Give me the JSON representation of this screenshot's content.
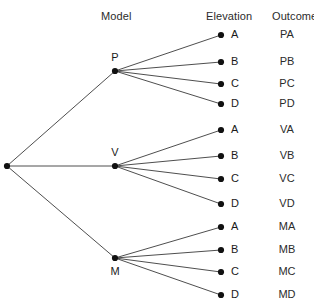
{
  "headers": {
    "model": "Model",
    "elevation": "Elevation",
    "outcome": "Outcome"
  },
  "top_cut_text": "",
  "colors": {
    "background": "#ffffff",
    "line": "#3a3a3a",
    "node": "#111111",
    "text": "#1a1a1a"
  },
  "chart_data": {
    "type": "tree",
    "title": "",
    "columns": [
      "Model",
      "Elevation",
      "Outcome"
    ],
    "root": {
      "label": "",
      "x": 7,
      "y": 166
    },
    "levels": [
      {
        "name": "Model",
        "nodes": [
          {
            "label": "P",
            "x": 115,
            "y": 71,
            "label_pos": "above"
          },
          {
            "label": "V",
            "x": 115,
            "y": 166,
            "label_pos": "above"
          },
          {
            "label": "M",
            "x": 115,
            "y": 258,
            "label_pos": "below"
          }
        ]
      },
      {
        "name": "Elevation",
        "nodes": [
          {
            "label": "A",
            "x": 221,
            "y": 35,
            "parent": "P",
            "outcome": "PA"
          },
          {
            "label": "B",
            "x": 221,
            "y": 62,
            "parent": "P",
            "outcome": "PB"
          },
          {
            "label": "C",
            "x": 221,
            "y": 84,
            "parent": "P",
            "outcome": "PC"
          },
          {
            "label": "D",
            "x": 221,
            "y": 104,
            "parent": "P",
            "outcome": "PD"
          },
          {
            "label": "A",
            "x": 221,
            "y": 130,
            "parent": "V",
            "outcome": "VA"
          },
          {
            "label": "B",
            "x": 221,
            "y": 156,
            "parent": "V",
            "outcome": "VB"
          },
          {
            "label": "C",
            "x": 221,
            "y": 179,
            "parent": "V",
            "outcome": "VC"
          },
          {
            "label": "D",
            "x": 221,
            "y": 204,
            "parent": "V",
            "outcome": "VD"
          },
          {
            "label": "A",
            "x": 221,
            "y": 227,
            "parent": "M",
            "outcome": "MA"
          },
          {
            "label": "B",
            "x": 221,
            "y": 250,
            "parent": "M",
            "outcome": "MB"
          },
          {
            "label": "C",
            "x": 221,
            "y": 272,
            "parent": "M",
            "outcome": "MC"
          },
          {
            "label": "D",
            "x": 221,
            "y": 295,
            "parent": "M",
            "outcome": "MD"
          }
        ]
      }
    ],
    "edges": [
      {
        "from": "root",
        "to": "P"
      },
      {
        "from": "root",
        "to": "V"
      },
      {
        "from": "root",
        "to": "M"
      },
      {
        "from": "P",
        "to": "PA"
      },
      {
        "from": "P",
        "to": "PB"
      },
      {
        "from": "P",
        "to": "PC"
      },
      {
        "from": "P",
        "to": "PD"
      },
      {
        "from": "V",
        "to": "VA"
      },
      {
        "from": "V",
        "to": "VB"
      },
      {
        "from": "V",
        "to": "VC"
      },
      {
        "from": "V",
        "to": "VD"
      },
      {
        "from": "M",
        "to": "MA"
      },
      {
        "from": "M",
        "to": "MB"
      },
      {
        "from": "M",
        "to": "MC"
      },
      {
        "from": "M",
        "to": "MD"
      }
    ],
    "outcomes": [
      "PA",
      "PB",
      "PC",
      "PD",
      "VA",
      "VB",
      "VC",
      "VD",
      "MA",
      "MB",
      "MC",
      "MD"
    ],
    "model_values": [
      "P",
      "V",
      "M"
    ],
    "elevation_values": [
      "A",
      "B",
      "C",
      "D"
    ],
    "total_outcomes": 12
  },
  "layout": {
    "header_y": 10,
    "model_header_x": 101,
    "elevation_header_x": 206,
    "outcome_header_x": 272,
    "outcome_column_x": 287,
    "leaf_label_offset_x": 10
  }
}
